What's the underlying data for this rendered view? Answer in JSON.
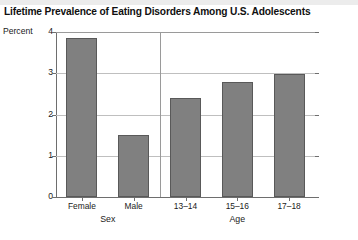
{
  "chart_data": {
    "type": "bar",
    "title": "Lifetime Prevalence of Eating Disorders Among U.S. Adolescents",
    "xlabel": "",
    "ylabel": "Percent",
    "ylim": [
      0,
      4
    ],
    "yticks": [
      0,
      1,
      2,
      3,
      4
    ],
    "ytick_labels": [
      "0",
      "1",
      "2",
      "3",
      "4"
    ],
    "grid": true,
    "legend": "none",
    "categories": [
      "Female",
      "Male",
      "13–14",
      "15–16",
      "17–18"
    ],
    "values": [
      3.85,
      1.5,
      2.4,
      2.78,
      2.98
    ],
    "groups": [
      {
        "label": "Sex",
        "categories": [
          "Female",
          "Male"
        ]
      },
      {
        "label": "Age",
        "categories": [
          "13–14",
          "15–16",
          "17–18"
        ]
      }
    ],
    "bars": [
      {
        "category": "Female",
        "group": "Sex",
        "value": 3.85
      },
      {
        "category": "Male",
        "group": "Sex",
        "value": 1.5
      },
      {
        "category": "13–14",
        "group": "Age",
        "value": 2.4
      },
      {
        "category": "15–16",
        "group": "Age",
        "value": 2.78
      },
      {
        "category": "17–18",
        "group": "Age",
        "value": 2.98
      }
    ],
    "colors": {
      "bar_fill": "#808080",
      "bar_edge": "#595959",
      "gridline": "#bfbfbf",
      "axis": "#6e6e6e",
      "text": "#1a1a1a",
      "background": "#ffffff",
      "top_band": "#ececec"
    }
  },
  "footnote": ""
}
